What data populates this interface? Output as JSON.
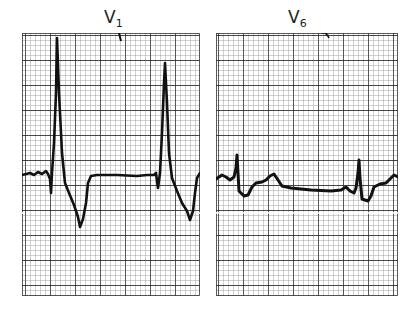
{
  "figure": {
    "panels": [
      {
        "id": "v1",
        "label_main": "V",
        "label_sub": "1",
        "description": "Lead V1 tracing: tall narrow R waves with deep negative T waves"
      },
      {
        "id": "v6",
        "label_main": "V",
        "label_sub": "6",
        "description": "Lead V6 tracing: small sharp deflections with low-amplitude undulating baseline"
      }
    ],
    "grid": {
      "minor_spacing_px": 5,
      "major_every": 5,
      "minor_color": "#9a9a9a",
      "major_color": "#1a1a1a"
    },
    "trace_color": "#111111"
  }
}
